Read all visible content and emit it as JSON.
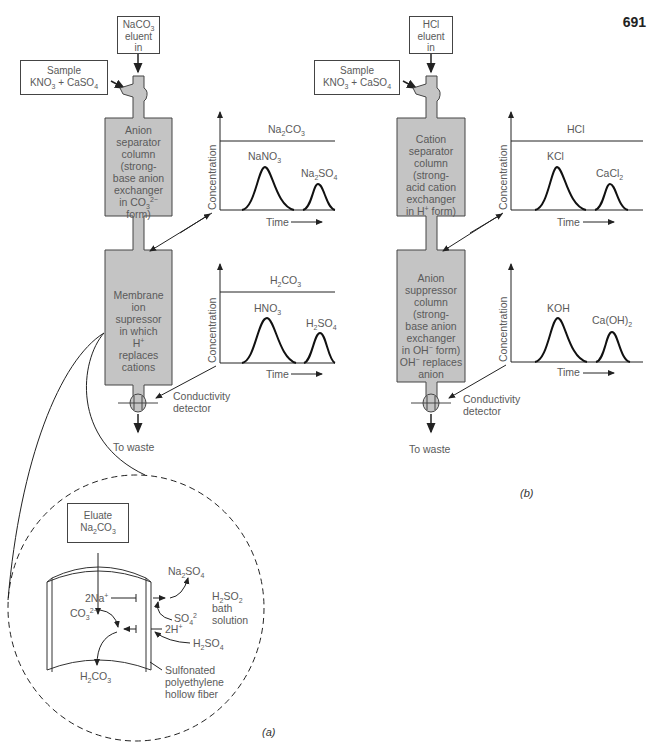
{
  "page_number": "691",
  "panel_a": {
    "caption": "(a)",
    "eluent_box": [
      "NaCO3",
      "eluent",
      "in"
    ],
    "eluent_box_html": "NaCO<sub>3</sub><br>eluent<br>in",
    "sample_box_html": "Sample<br>KNO<sub>3</sub> + CaSO<sub>4</sub>",
    "separator_column_html": "Anion<br>separator<br>column<br>(strong-<br>base anion<br>exchanger<br>in CO<sub>3</sub><sup>2−</sup><br>form)",
    "suppressor_html": "Membrane<br>ion<br>supressor<br>in which<br>H<sup>+</sup><br>replaces<br>cations",
    "detector_label_html": "Conductivity<br>detector",
    "waste_label": "To waste",
    "chart1": {
      "ylabel": "Concentration",
      "xlabel": "Time",
      "baseline_label_html": "Na<sub>2</sub>CO<sub>3</sub>",
      "peak1_html": "NaNO<sub>3</sub>",
      "peak2_html": "Na<sub>2</sub>SO<sub>4</sub>"
    },
    "chart2": {
      "ylabel": "Concentration",
      "xlabel": "Time",
      "baseline_label_html": "H<sub>2</sub>CO<sub>3</sub>",
      "peak1_html": "HNO<sub>3</sub>",
      "peak2_html": "H<sub>2</sub>SO<sub>4</sub>"
    },
    "inset": {
      "eluate_box_html": "Eluate<br>Na<sub>2</sub>CO<sub>3</sub>",
      "na_ion_html": "2Na<sup>+</sup>",
      "co3_ion_html": "CO<sub>3</sub><sup>2−</sup>",
      "h2co3_html": "H<sub>2</sub>CO<sub>3</sub>",
      "na2so4_html": "Na<sub>2</sub>SO<sub>4</sub>",
      "so4_html": "SO<sub>4</sub><sup>2</sup>",
      "h_ion_html": "2H<sup>+</sup>",
      "h2so4_html": "H<sub>2</sub>SO<sub>4</sub>",
      "bath_html": "H<sub>2</sub>SO<sub>2</sub><br>bath<br>solution",
      "fiber_html": "Sulfonated<br>polyethylene<br>hollow fiber"
    }
  },
  "panel_b": {
    "caption": "(b)",
    "eluent_box_html": "HCl<br>eluent<br>in",
    "sample_box_html": "Sample<br>KNO<sub>3</sub> + CaSO<sub>4</sub>",
    "separator_column_html": "Cation<br>separator<br>column<br>(strong-<br>acid cation<br>exchanger<br>in H<sup>+</sup> form)",
    "suppressor_html": "Anion<br>suppressor<br>column<br>(strong-<br>base anion<br>exchanger<br>in OH<sup>−</sup> form)<br>OH<sup>−</sup> replaces<br>anion",
    "detector_label_html": "Conductivity<br>detector",
    "waste_label": "To waste",
    "chart1": {
      "ylabel": "Concentration",
      "xlabel": "Time",
      "baseline_label_html": "HCl",
      "peak1_html": "KCl",
      "peak2_html": "CaCl<sub>2</sub>"
    },
    "chart2": {
      "ylabel": "Concentration",
      "xlabel": "Time",
      "peak1_html": "KOH",
      "peak2_html": "Ca(OH)<sub>2</sub>"
    }
  },
  "colors": {
    "column_fill": "#c4c4c4",
    "line": "#222222",
    "text": "#5a5a5a"
  }
}
